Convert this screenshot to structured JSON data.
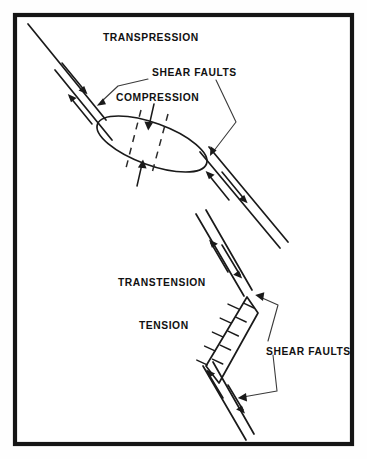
{
  "figure": {
    "background_color": "#fefefe",
    "border_color": "#151515",
    "ink_color": "#1a1a1a",
    "width": 367,
    "height": 459
  },
  "panels": [
    {
      "id": "transpression",
      "name": "Transpression panel",
      "regime_label": "TRANSPRESSION",
      "stress_label": "COMPRESSION",
      "fault_label": "SHEAR FAULTS",
      "structure": "restraining bend push-up block (ellipse)",
      "fault_sense": "strike-slip with convergent offset",
      "arrow_count": 4
    },
    {
      "id": "transtension",
      "name": "Transtension panel",
      "regime_label": "TRANSTENSION",
      "stress_label": "TENSION",
      "fault_label": "SHEAR FAULTS",
      "structure": "releasing bend pull-apart basin (rhomboid)",
      "fault_sense": "strike-slip with divergent offset",
      "arrow_count": 4
    }
  ],
  "labels": {
    "transpression": "TRANSPRESSION",
    "shear_faults_upper": "SHEAR FAULTS",
    "compression": "COMPRESSION",
    "transtension": "TRANSTENSION",
    "tension": "TENSION",
    "shear_faults_lower": "SHEAR FAULTS"
  }
}
